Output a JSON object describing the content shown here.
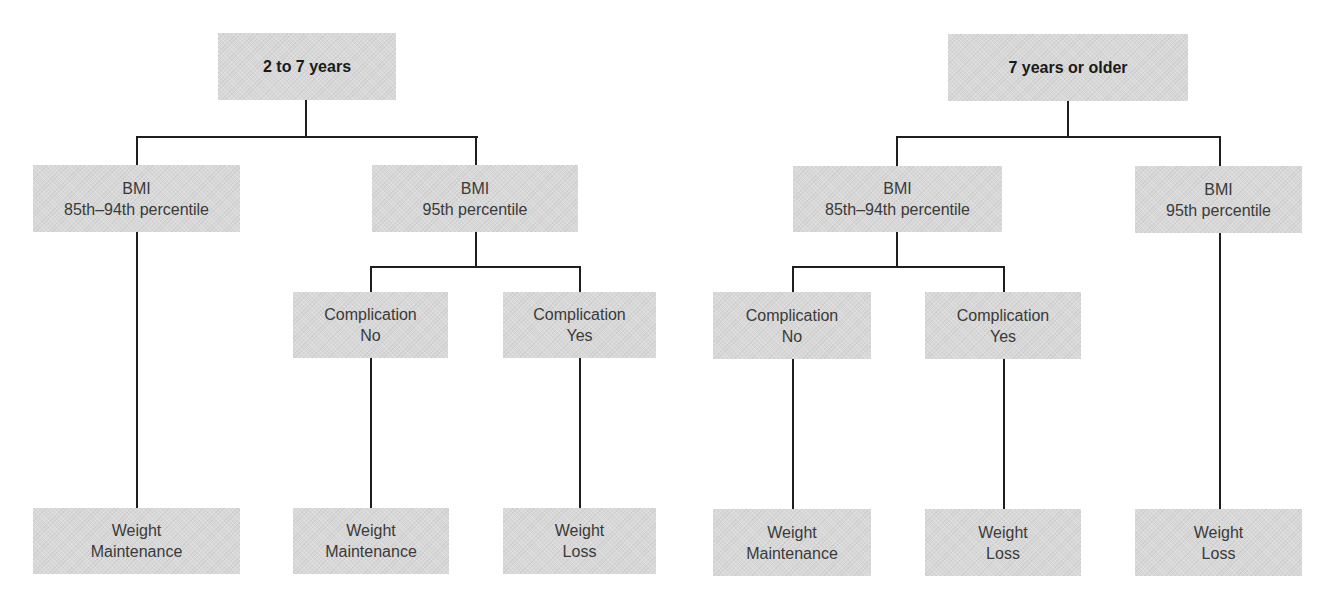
{
  "diagram": {
    "type": "decision-tree",
    "colors": {
      "box_fill": "#d8d8d8",
      "line": "#1e1e1e",
      "text": "#3a3a3a",
      "root_text": "#1a1a1a"
    },
    "trees": [
      {
        "root": {
          "label": "2 to 7 years"
        },
        "bmi_85_94": {
          "line1": "BMI",
          "line2": "85th–94th percentile"
        },
        "bmi_95": {
          "line1": "BMI",
          "line2": "95th percentile"
        },
        "comp_no": {
          "line1": "Complication",
          "line2": "No"
        },
        "comp_yes": {
          "line1": "Complication",
          "line2": "Yes"
        },
        "out_bmi_85_94": {
          "line1": "Weight",
          "line2": "Maintenance"
        },
        "out_comp_no": {
          "line1": "Weight",
          "line2": "Maintenance"
        },
        "out_comp_yes": {
          "line1": "Weight",
          "line2": "Loss"
        }
      },
      {
        "root": {
          "label": "7 years or older"
        },
        "bmi_85_94": {
          "line1": "BMI",
          "line2": "85th–94th percentile"
        },
        "bmi_95": {
          "line1": "BMI",
          "line2": "95th percentile"
        },
        "comp_no": {
          "line1": "Complication",
          "line2": "No"
        },
        "comp_yes": {
          "line1": "Complication",
          "line2": "Yes"
        },
        "out_comp_no": {
          "line1": "Weight",
          "line2": "Maintenance"
        },
        "out_comp_yes": {
          "line1": "Weight",
          "line2": "Loss"
        },
        "out_bmi_95": {
          "line1": "Weight",
          "line2": "Loss"
        }
      }
    ]
  }
}
